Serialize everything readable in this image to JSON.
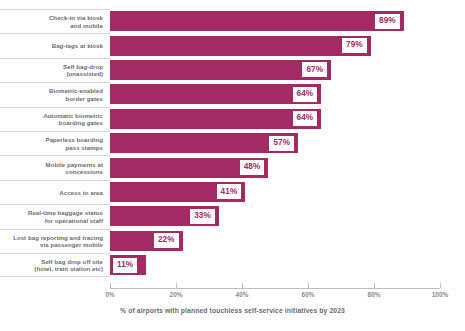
{
  "chart_data": {
    "type": "bar",
    "orientation": "horizontal",
    "title": "",
    "subtitle": "",
    "xlabel": "% of airports with planned touchless self-service initiatives by 2023",
    "ylabel": "",
    "xlim": [
      0,
      100
    ],
    "xticks": [
      "0%",
      "20%",
      "40%",
      "60%",
      "80%",
      "100%"
    ],
    "xtick_values": [
      0,
      20,
      40,
      60,
      80,
      100
    ],
    "grid": false,
    "legend": "none",
    "bar_color": "#a32a63",
    "label_color": "#6b6b70",
    "categories": [
      "Check-in via kiosk and mobile",
      "Bag-tags at kiosk",
      "Self bag-drop (unassisted)",
      "Biometric-enabled border gates",
      "Automatic biometric boarding gates",
      "Paperless boarding pass stamps",
      "Mobile payments at concessions",
      "Access to area",
      "Real-time baggage status for operational staff",
      "Lost bag reporting and tracing via passenger mobile",
      "Self bag drop off site (hotel, train station etc)"
    ],
    "category_lines": [
      [
        "Check-in via kiosk",
        "and mobile"
      ],
      [
        "Bag-tags at kiosk"
      ],
      [
        "Self bag-drop",
        "(unassisted)"
      ],
      [
        "Biometric-enabled",
        "border gates"
      ],
      [
        "Automatic biometric",
        "boarding gates"
      ],
      [
        "Paperless boarding",
        "pass stamps"
      ],
      [
        "Mobile payments at",
        "concessions"
      ],
      [
        "Access to area"
      ],
      [
        "Real-time baggage status",
        "for operational staff"
      ],
      [
        "Lost bag reporting and tracing",
        "via passenger mobile"
      ],
      [
        "Self bag drop off site",
        "(hotel, train station etc)"
      ]
    ],
    "values": [
      89,
      79,
      67,
      64,
      64,
      57,
      48,
      41,
      33,
      22,
      11
    ],
    "value_labels": [
      "89%",
      "79%",
      "67%",
      "64%",
      "64%",
      "57%",
      "48%",
      "41%",
      "33%",
      "22%",
      "11%"
    ]
  }
}
